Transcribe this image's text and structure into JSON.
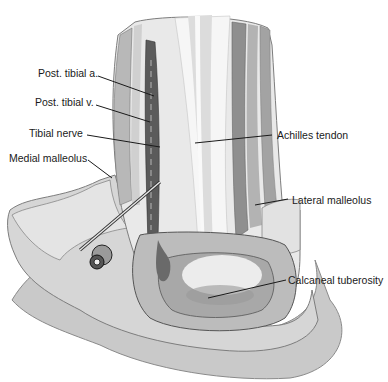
{
  "figure": {
    "labels": {
      "post_tibial_a": "Post. tibial a.",
      "post_tibial_v": "Post. tibial v.",
      "tibial_nerve": "Tibial nerve",
      "medial_malleolus": "Medial malleolus",
      "achilles_tendon": "Achilles tendon",
      "lateral_malleolus": "Lateral malleolus",
      "calcaneal_tuberosity": "Calcaneal tuberosity"
    },
    "colors": {
      "background": "#ffffff",
      "light_gray": "#e6e6e6",
      "mid_gray": "#bdbdbd",
      "dark_gray": "#7d7d7d",
      "vessel": "#4a4a4a",
      "line": "#1a1a1a"
    }
  }
}
